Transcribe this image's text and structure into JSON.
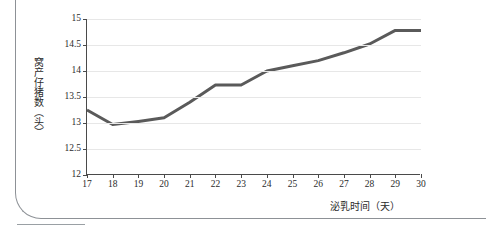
{
  "chart_data": {
    "type": "line",
    "title": "",
    "xlabel": "泌乳时间（天）",
    "ylabel": "窝产仔猪数（头）",
    "x": [
      17,
      18,
      19,
      20,
      21,
      22,
      23,
      24,
      25,
      26,
      27,
      28,
      29,
      30
    ],
    "xticklabels": [
      "17",
      "18",
      "19",
      "20",
      "21",
      "22",
      "23",
      "24",
      "25",
      "26",
      "27",
      "28",
      "29",
      "30"
    ],
    "yticklabels": [
      "12",
      "12.5",
      "13",
      "13.5",
      "14",
      "14.5",
      "15"
    ],
    "yticks": [
      12,
      12.5,
      13,
      13.5,
      14,
      14.5,
      15
    ],
    "xlim": [
      17,
      30
    ],
    "ylim": [
      12,
      15
    ],
    "grid": "horizontal",
    "legend": "none",
    "series": [
      {
        "name": "窝产仔猪数",
        "color": "#5a5a5a",
        "values": [
          13.25,
          12.97,
          13.03,
          13.1,
          13.4,
          13.73,
          13.73,
          14.0,
          14.1,
          14.2,
          14.35,
          14.52,
          14.78,
          14.78
        ]
      }
    ]
  },
  "axes": {
    "y_title": "窝产仔猪数（头）",
    "x_title": "泌乳时间（天）"
  },
  "colors": {
    "series_line": "#5a5a5a",
    "axis": "#4a4a4a",
    "grid": "#e7e7e7",
    "page_frame": "#8d9196"
  }
}
